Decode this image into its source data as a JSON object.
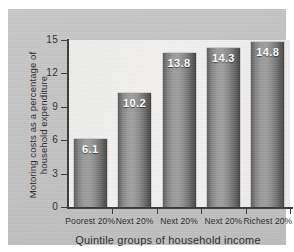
{
  "chart_data": {
    "type": "bar",
    "title": "",
    "subtitle": "",
    "categories": [
      "Poorest 20%",
      "Next 20%",
      "Next 20%",
      "Next 20%",
      "Richest 20%"
    ],
    "values": [
      6.1,
      10.2,
      13.8,
      14.3,
      14.8
    ],
    "value_labels": [
      "6.1",
      "10.2",
      "13.8",
      "14.3",
      "14.8"
    ],
    "xlabel": "Quintile groups of household income",
    "ylabel_line1": "Motoring costs as a percentage of",
    "ylabel_line2": "household expenditure",
    "ylabel": "Motoring costs as a percentage of household expenditure",
    "ylim": [
      0,
      15
    ],
    "yticks": [
      0,
      3,
      6,
      9,
      12,
      15
    ],
    "ytick_labels": [
      "0",
      "3",
      "6",
      "9",
      "12",
      "15"
    ],
    "grid": false,
    "legend": false,
    "legend_position": "none",
    "series": [
      {
        "name": "Motoring costs as a percentage of household expenditure",
        "values": [
          6.1,
          10.2,
          13.8,
          14.3,
          14.8
        ]
      }
    ]
  },
  "colors": {
    "panel_background": "#c3c3c3",
    "plot_background": "#eeedec",
    "axis": "#3b3b3b",
    "bar_light": "#9e9e9e",
    "bar_dark": "#3f3f3f",
    "value_label": "#ffffff",
    "text": "#2c2c2c"
  }
}
